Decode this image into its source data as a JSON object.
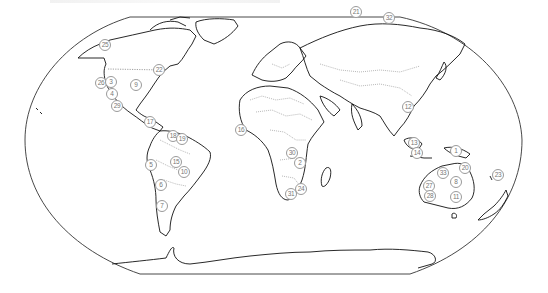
{
  "map": {
    "type": "world-outline-map",
    "projection": "robinson-like oval",
    "colors": {
      "outline": "#222222",
      "border": "#888888",
      "marker_ring": "#9a9a9a",
      "marker_text": "#777777"
    },
    "markers": [
      {
        "id": "25",
        "label": "25",
        "x": 105,
        "y": 45,
        "region": "Alaska"
      },
      {
        "id": "22",
        "label": "22",
        "x": 159,
        "y": 70,
        "region": "Great Lakes"
      },
      {
        "id": "26",
        "label": "26",
        "x": 101,
        "y": 83,
        "region": "US West Coast"
      },
      {
        "id": "3",
        "label": "3",
        "x": 111,
        "y": 82,
        "region": "US West"
      },
      {
        "id": "9",
        "label": "9",
        "x": 136,
        "y": 85,
        "region": "US Central"
      },
      {
        "id": "4",
        "label": "4",
        "x": 112,
        "y": 94,
        "region": "US Southwest"
      },
      {
        "id": "29",
        "label": "29",
        "x": 117,
        "y": 106,
        "region": "Mexico North"
      },
      {
        "id": "17",
        "label": "17",
        "x": 150,
        "y": 122,
        "region": "Caribbean"
      },
      {
        "id": "18",
        "label": "18",
        "x": 173,
        "y": 136,
        "region": "Venezuela"
      },
      {
        "id": "19",
        "label": "19",
        "x": 182,
        "y": 139,
        "region": "Guianas"
      },
      {
        "id": "5",
        "label": "5",
        "x": 151,
        "y": 165,
        "region": "Peru"
      },
      {
        "id": "15",
        "label": "15",
        "x": 176,
        "y": 162,
        "region": "Bolivia/Brazil"
      },
      {
        "id": "10",
        "label": "10",
        "x": 184,
        "y": 172,
        "region": "Brazil South"
      },
      {
        "id": "6",
        "label": "6",
        "x": 161,
        "y": 185,
        "region": "Chile North"
      },
      {
        "id": "7",
        "label": "7",
        "x": 162,
        "y": 206,
        "region": "Chile South"
      },
      {
        "id": "16",
        "label": "16",
        "x": 241,
        "y": 130,
        "region": "West Africa"
      },
      {
        "id": "30",
        "label": "30",
        "x": 292,
        "y": 153,
        "region": "Central Africa"
      },
      {
        "id": "2",
        "label": "2",
        "x": 300,
        "y": 163,
        "region": "Southern Africa"
      },
      {
        "id": "31",
        "label": "31",
        "x": 291,
        "y": 194,
        "region": "South Africa West"
      },
      {
        "id": "24",
        "label": "24",
        "x": 301,
        "y": 189,
        "region": "South Africa East"
      },
      {
        "id": "21",
        "label": "21",
        "x": 356,
        "y": 12,
        "region": "Northern Russia"
      },
      {
        "id": "32",
        "label": "32",
        "x": 389,
        "y": 18,
        "region": "Siberia"
      },
      {
        "id": "12",
        "label": "12",
        "x": 408,
        "y": 107,
        "region": "Southeast Asia"
      },
      {
        "id": "13",
        "label": "13",
        "x": 414,
        "y": 143,
        "region": "Borneo"
      },
      {
        "id": "14",
        "label": "14",
        "x": 417,
        "y": 153,
        "region": "Indonesia"
      },
      {
        "id": "1",
        "label": "1",
        "x": 456,
        "y": 151,
        "region": "New Guinea"
      },
      {
        "id": "20",
        "label": "20",
        "x": 465,
        "y": 168,
        "region": "Queensland North"
      },
      {
        "id": "33",
        "label": "33",
        "x": 443,
        "y": 173,
        "region": "Northern Australia"
      },
      {
        "id": "8",
        "label": "8",
        "x": 456,
        "y": 182,
        "region": "Central Australia"
      },
      {
        "id": "27",
        "label": "27",
        "x": 429,
        "y": 186,
        "region": "Western Australia"
      },
      {
        "id": "28",
        "label": "28",
        "x": 430,
        "y": 196,
        "region": "Southwest Australia"
      },
      {
        "id": "11",
        "label": "11",
        "x": 456,
        "y": 197,
        "region": "Southeast Australia"
      },
      {
        "id": "23",
        "label": "23",
        "x": 498,
        "y": 175,
        "region": "New Caledonia / Pacific"
      }
    ]
  }
}
